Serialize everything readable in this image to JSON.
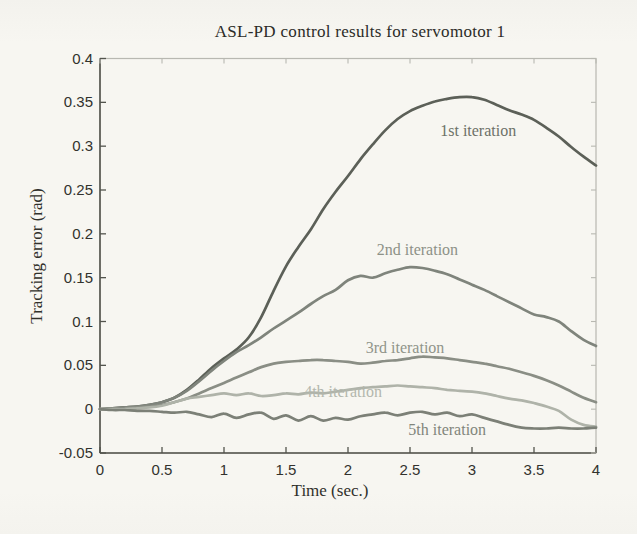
{
  "chart_data": {
    "type": "line",
    "title": "ASL-PD control results for servomotor 1",
    "xlabel": "Time (sec.)",
    "ylabel": "Tracking error (rad)",
    "xlim": [
      0,
      4
    ],
    "ylim": [
      -0.05,
      0.4
    ],
    "grid": false,
    "legend": "inline-annotations",
    "xticks": [
      0,
      0.5,
      1,
      1.5,
      2,
      2.5,
      3,
      3.5,
      4
    ],
    "xtick_labels": [
      "0",
      "0.5",
      "1",
      "1.5",
      "2",
      "2.5",
      "3",
      "3.5",
      "4"
    ],
    "yticks": [
      -0.05,
      0,
      0.05,
      0.1,
      0.15,
      0.2,
      0.25,
      0.3,
      0.35,
      0.4
    ],
    "ytick_labels": [
      "-0.05",
      "0",
      "0.05",
      "0.1",
      "0.15",
      "0.2",
      "0.25",
      "0.3",
      "0.35",
      "0.4"
    ],
    "x_step": 0.1,
    "background": "#f7f6f1",
    "axis_color": "#53544d",
    "box_color": "#b8b8b1",
    "text_color": "#32322d",
    "series": [
      {
        "name": "1st iteration",
        "color": "#5c6058",
        "label_color": "#6d7168",
        "label_pos": {
          "t": 3.05,
          "v": 0.317
        },
        "values": [
          0.0,
          0.001,
          0.002,
          0.003,
          0.005,
          0.008,
          0.013,
          0.022,
          0.034,
          0.047,
          0.058,
          0.068,
          0.082,
          0.105,
          0.135,
          0.163,
          0.185,
          0.205,
          0.228,
          0.248,
          0.266,
          0.285,
          0.302,
          0.318,
          0.331,
          0.34,
          0.346,
          0.351,
          0.354,
          0.356,
          0.356,
          0.353,
          0.347,
          0.341,
          0.336,
          0.33,
          0.321,
          0.311,
          0.299,
          0.288,
          0.278
        ]
      },
      {
        "name": "2nd iteration",
        "color": "#7f847b",
        "label_color": "#8d9187",
        "label_pos": {
          "t": 2.56,
          "v": 0.181
        },
        "values": [
          0.0,
          0.001,
          0.002,
          0.003,
          0.005,
          0.008,
          0.013,
          0.021,
          0.032,
          0.044,
          0.055,
          0.065,
          0.073,
          0.082,
          0.092,
          0.101,
          0.11,
          0.12,
          0.129,
          0.136,
          0.147,
          0.152,
          0.15,
          0.155,
          0.159,
          0.162,
          0.161,
          0.158,
          0.154,
          0.148,
          0.142,
          0.136,
          0.129,
          0.122,
          0.115,
          0.108,
          0.105,
          0.1,
          0.089,
          0.079,
          0.072
        ]
      },
      {
        "name": "3rd iteration",
        "color": "#8a8e85",
        "label_color": "#90948a",
        "label_pos": {
          "t": 2.46,
          "v": 0.07
        },
        "values": [
          0.0,
          0.0,
          0.001,
          0.002,
          0.003,
          0.005,
          0.008,
          0.012,
          0.018,
          0.024,
          0.03,
          0.036,
          0.042,
          0.048,
          0.052,
          0.054,
          0.055,
          0.056,
          0.056,
          0.055,
          0.054,
          0.052,
          0.053,
          0.055,
          0.056,
          0.058,
          0.06,
          0.059,
          0.058,
          0.056,
          0.054,
          0.052,
          0.049,
          0.046,
          0.042,
          0.038,
          0.033,
          0.027,
          0.02,
          0.013,
          0.008
        ]
      },
      {
        "name": "4th iteration",
        "color": "#afb3a9",
        "label_color": "#b3b7ad",
        "label_pos": {
          "t": 1.96,
          "v": 0.02
        },
        "values": [
          0.0,
          0.0,
          0.0,
          0.001,
          0.002,
          0.004,
          0.008,
          0.012,
          0.014,
          0.016,
          0.018,
          0.016,
          0.018,
          0.015,
          0.016,
          0.018,
          0.017,
          0.019,
          0.018,
          0.02,
          0.022,
          0.024,
          0.025,
          0.026,
          0.027,
          0.026,
          0.025,
          0.024,
          0.022,
          0.021,
          0.02,
          0.018,
          0.015,
          0.012,
          0.01,
          0.007,
          0.003,
          -0.002,
          -0.012,
          -0.018,
          -0.02
        ]
      },
      {
        "name": "5th iteration",
        "color": "#7c8077",
        "label_color": "#81857b",
        "label_pos": {
          "t": 2.8,
          "v": -0.0235
        },
        "values": [
          0.0,
          -0.001,
          -0.001,
          -0.002,
          -0.002,
          -0.003,
          -0.004,
          -0.003,
          -0.006,
          -0.009,
          -0.005,
          -0.01,
          -0.006,
          -0.004,
          -0.011,
          -0.007,
          -0.013,
          -0.008,
          -0.013,
          -0.01,
          -0.012,
          -0.008,
          -0.006,
          -0.004,
          -0.007,
          -0.004,
          -0.003,
          -0.006,
          -0.004,
          -0.008,
          -0.006,
          -0.01,
          -0.014,
          -0.018,
          -0.021,
          -0.022,
          -0.022,
          -0.021,
          -0.022,
          -0.022,
          -0.021
        ]
      }
    ]
  }
}
